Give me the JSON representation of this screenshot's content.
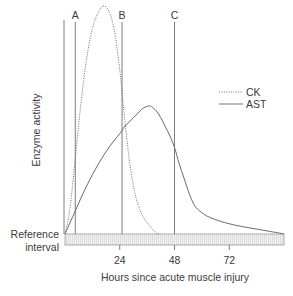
{
  "chart_data": {
    "type": "line",
    "title": "",
    "xlabel": "Hours since acute muscle injury",
    "ylabel": "Enzyme activity",
    "xlim": [
      0,
      96
    ],
    "ylim": [
      0,
      100
    ],
    "x_ticks": [
      24,
      48,
      72
    ],
    "x_tick_labels": [
      "24",
      "48",
      "72"
    ],
    "grid": false,
    "legend_position": "right",
    "reference_band": {
      "label_line1": "Reference",
      "label_line2": "interval",
      "range_hours": [
        0,
        96
      ]
    },
    "markers": [
      {
        "label": "A",
        "x": 4.5
      },
      {
        "label": "B",
        "x": 25
      },
      {
        "label": "C",
        "x": 48
      }
    ],
    "series": [
      {
        "name": "CK",
        "style": "dotted",
        "points": [
          [
            0,
            0
          ],
          [
            2,
            10
          ],
          [
            4,
            28
          ],
          [
            6,
            48
          ],
          [
            8,
            66
          ],
          [
            10,
            80
          ],
          [
            12,
            90
          ],
          [
            14,
            96
          ],
          [
            16,
            99.5
          ],
          [
            17,
            100
          ],
          [
            18,
            99.5
          ],
          [
            20,
            96
          ],
          [
            22,
            87
          ],
          [
            24,
            72
          ],
          [
            25,
            62
          ],
          [
            26,
            52
          ],
          [
            28,
            34
          ],
          [
            30,
            21
          ],
          [
            32,
            13
          ],
          [
            34,
            8
          ],
          [
            36,
            5
          ],
          [
            38,
            2.5
          ],
          [
            40,
            0.5
          ],
          [
            41,
            0
          ]
        ]
      },
      {
        "name": "AST",
        "style": "solid",
        "points": [
          [
            0,
            0
          ],
          [
            4,
            9
          ],
          [
            8,
            18
          ],
          [
            12,
            26
          ],
          [
            16,
            33
          ],
          [
            20,
            39
          ],
          [
            24,
            44
          ],
          [
            26,
            47
          ],
          [
            28,
            49
          ],
          [
            30,
            51
          ],
          [
            32,
            53
          ],
          [
            34,
            55
          ],
          [
            36,
            56
          ],
          [
            37,
            56.2
          ],
          [
            38,
            55.8
          ],
          [
            40,
            54
          ],
          [
            42,
            51
          ],
          [
            44,
            47
          ],
          [
            46,
            43
          ],
          [
            48,
            38
          ],
          [
            50,
            31
          ],
          [
            52,
            25
          ],
          [
            54,
            19
          ],
          [
            56,
            14
          ],
          [
            58,
            11
          ],
          [
            62,
            8
          ],
          [
            66,
            6.3
          ],
          [
            70,
            5
          ],
          [
            74,
            4
          ],
          [
            78,
            3.2
          ],
          [
            82,
            2.5
          ],
          [
            86,
            1.8
          ],
          [
            90,
            1.1
          ],
          [
            94,
            0.4
          ],
          [
            96,
            0
          ]
        ]
      }
    ]
  }
}
